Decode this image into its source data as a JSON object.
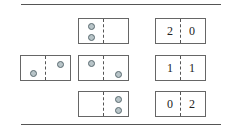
{
  "diagram": {
    "left": {
      "label": "two balls, one in each half"
    },
    "middle": [
      {
        "label": "both balls left"
      },
      {
        "label": "one ball each side"
      },
      {
        "label": "both balls right"
      }
    ],
    "right": [
      {
        "left": "2",
        "right": "0"
      },
      {
        "left": "1",
        "right": "1"
      },
      {
        "left": "0",
        "right": "2"
      }
    ]
  }
}
